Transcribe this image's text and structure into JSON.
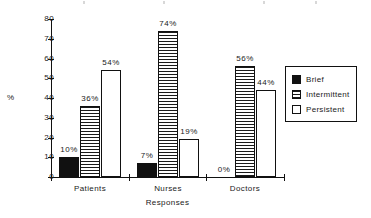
{
  "chart_data": {
    "type": "bar",
    "title": "",
    "xlabel": "Responses",
    "ylabel": "%",
    "categories": [
      "Patients",
      "Nurses",
      "Doctors"
    ],
    "ylim": [
      0,
      80
    ],
    "yticks": [
      0,
      10,
      20,
      30,
      40,
      50,
      60,
      70,
      80
    ],
    "ytick_labels": [
      "0",
      "10",
      "20",
      "30",
      "40",
      "50",
      "60",
      "70",
      "80"
    ],
    "grid": false,
    "legend_position": "right",
    "value_label_suffix": "%",
    "series": [
      {
        "name": "Brief",
        "fill": "solid-black",
        "color": "#111111",
        "values": [
          10,
          7,
          0
        ],
        "labels": [
          "10%",
          "7%",
          "0%"
        ]
      },
      {
        "name": "Intermittent",
        "fill": "horizontal-stripes",
        "color": "#111111",
        "values": [
          36,
          74,
          56
        ],
        "labels": [
          "36%",
          "74%",
          "56%"
        ]
      },
      {
        "name": "Persistent",
        "fill": "white",
        "color": "#ffffff",
        "values": [
          54,
          19,
          44
        ],
        "labels": [
          "54%",
          "19%",
          "44%"
        ]
      }
    ]
  },
  "legend": {
    "items": [
      {
        "label": "Brief",
        "swatch": "solid-black-swatch-icon"
      },
      {
        "label": "Intermittent",
        "swatch": "striped-swatch-icon"
      },
      {
        "label": "Persistent",
        "swatch": "white-swatch-icon"
      }
    ]
  }
}
